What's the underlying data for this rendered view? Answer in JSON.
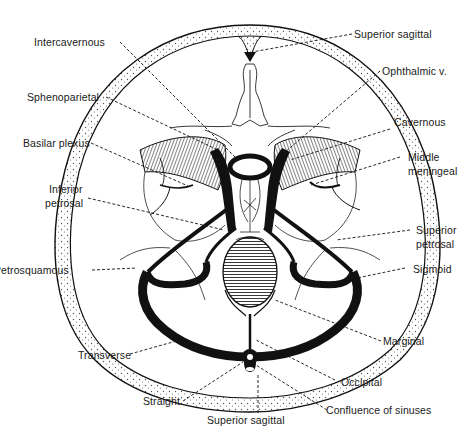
{
  "figure": {
    "colors": {
      "ink": "#111111",
      "background": "#ffffff",
      "bone_stipple": "#444444"
    }
  },
  "labels": {
    "left": [
      {
        "id": "intercavernous",
        "text": "Intercavernous"
      },
      {
        "id": "sphenoparietal",
        "text": "Sphenoparietal"
      },
      {
        "id": "basilar_plexus",
        "text": "Basilar plexus"
      },
      {
        "id": "inferior_petrosal_1",
        "text": "Inferior"
      },
      {
        "id": "inferior_petrosal_2",
        "text": "petrosal"
      },
      {
        "id": "petrosquamous",
        "text": "Petrosquamous"
      },
      {
        "id": "transverse",
        "text": "Transverse"
      },
      {
        "id": "straight",
        "text": "Straight"
      }
    ],
    "right": [
      {
        "id": "superior_sagittal_top",
        "text": "Superior sagittal"
      },
      {
        "id": "ophthalmic",
        "text": "Ophthalmic v."
      },
      {
        "id": "cavernous",
        "text": "Cavernous"
      },
      {
        "id": "middle_meningeal_1",
        "text": "Middle"
      },
      {
        "id": "middle_meningeal_2",
        "text": "meningeal"
      },
      {
        "id": "superior_petrosal_1",
        "text": "Superior"
      },
      {
        "id": "superior_petrosal_2",
        "text": "petrosal"
      },
      {
        "id": "sigmoid",
        "text": "Sigmoid"
      },
      {
        "id": "marginal",
        "text": "Marginal"
      },
      {
        "id": "occipital",
        "text": "Occipital"
      },
      {
        "id": "confluence",
        "text": "Confluence of sinuses"
      }
    ],
    "bottom": [
      {
        "id": "superior_sagittal_bottom",
        "text": "Superior sagittal"
      }
    ]
  }
}
